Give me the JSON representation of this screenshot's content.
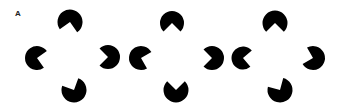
{
  "panel": {
    "label": "A"
  },
  "style": {
    "fill": "#000000",
    "background": "#ffffff"
  },
  "figures": [
    {
      "id": "set-1",
      "inducers": [
        {
          "position": "top",
          "cx": 70,
          "cy": 22,
          "r": 12.5,
          "mouth_dir": 100,
          "mouth_angle": 90
        },
        {
          "position": "left",
          "cx": 37,
          "cy": 58,
          "r": 12,
          "mouth_dir": 10,
          "mouth_angle": 90
        },
        {
          "position": "right",
          "cx": 108,
          "cy": 57,
          "r": 12,
          "mouth_dir": 180,
          "mouth_angle": 90
        },
        {
          "position": "bottom",
          "cx": 74,
          "cy": 90,
          "r": 12.5,
          "mouth_dir": 245,
          "mouth_angle": 90
        }
      ]
    },
    {
      "id": "set-2",
      "inducers": [
        {
          "position": "top",
          "cx": 172,
          "cy": 23,
          "r": 12,
          "mouth_dir": 90,
          "mouth_angle": 90
        },
        {
          "position": "left",
          "cx": 141,
          "cy": 58,
          "r": 12,
          "mouth_dir": 15,
          "mouth_angle": 90
        },
        {
          "position": "right",
          "cx": 212,
          "cy": 58,
          "r": 12,
          "mouth_dir": 180,
          "mouth_angle": 90
        },
        {
          "position": "bottom",
          "cx": 176,
          "cy": 90,
          "r": 12.5,
          "mouth_dir": 270,
          "mouth_angle": 90
        }
      ]
    },
    {
      "id": "set-3",
      "inducers": [
        {
          "position": "top",
          "cx": 275,
          "cy": 23,
          "r": 12.5,
          "mouth_dir": 90,
          "mouth_angle": 90
        },
        {
          "position": "left",
          "cx": 243,
          "cy": 58,
          "r": 11.5,
          "mouth_dir": 5,
          "mouth_angle": 90
        },
        {
          "position": "right",
          "cx": 313,
          "cy": 58,
          "r": 12,
          "mouth_dir": 195,
          "mouth_angle": 90
        },
        {
          "position": "bottom",
          "cx": 280,
          "cy": 90,
          "r": 12.5,
          "mouth_dir": 240,
          "mouth_angle": 90
        }
      ]
    }
  ]
}
